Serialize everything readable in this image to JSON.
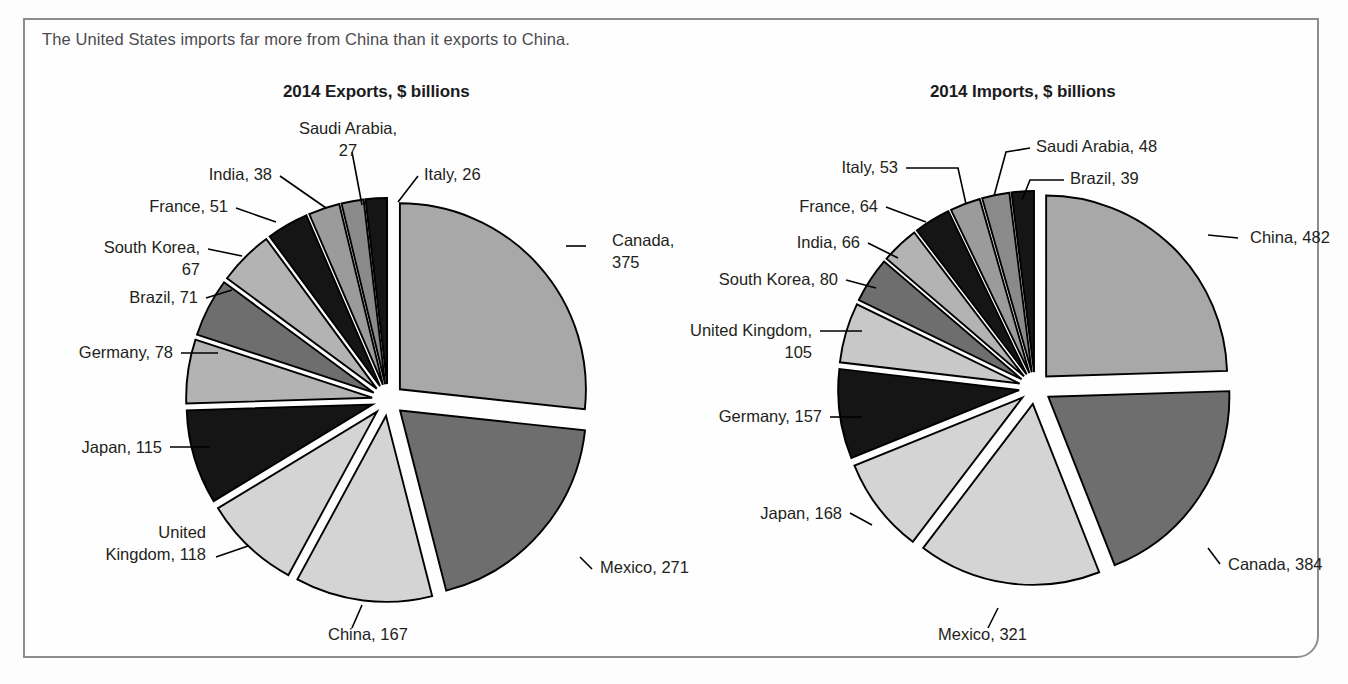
{
  "caption": "The United States imports far more from China than it exports to China.",
  "charts": [
    {
      "id": "exports",
      "title": "2014 Exports, $ billions",
      "unit": "$ billions",
      "center": {
        "x": 388,
        "y": 400
      },
      "radius": 186,
      "start_angle": -90,
      "slices": [
        {
          "label": "Canada",
          "value": 375,
          "text": "Canada,\n375",
          "color": "#a8a8a8",
          "lines": [
            "Canada,",
            "375"
          ],
          "label_x": 612,
          "label_y": 246,
          "anchor": "start",
          "leader": "M 566,246 L 586,246",
          "explode": 16
        },
        {
          "label": "Mexico",
          "value": 271,
          "text": "Mexico, 271",
          "color": "#6e6e6e",
          "lines": [
            "Mexico, 271"
          ],
          "label_x": 600,
          "label_y": 573,
          "anchor": "start",
          "leader": "M 580,557 L 592,569",
          "explode": 16
        },
        {
          "label": "China",
          "value": 167,
          "text": "China, 167",
          "color": "#d4d4d4",
          "lines": [
            "China, 167"
          ],
          "label_x": 328,
          "label_y": 640,
          "anchor": "start",
          "leader": "M 362,605 L 352,628",
          "explode": 16
        },
        {
          "label": "United Kingdom",
          "value": 118,
          "text": "United\nKingdom, 118",
          "color": "#d4d4d4",
          "lines": [
            "United",
            "Kingdom, 118"
          ],
          "label_x": 206,
          "label_y": 538,
          "anchor": "end",
          "leader": "M 216,557 L 248,546",
          "explode": 16
        },
        {
          "label": "Japan",
          "value": 115,
          "text": "Japan, 115",
          "color": "#151515",
          "lines": [
            "Japan, 115"
          ],
          "label_x": 162,
          "label_y": 453,
          "anchor": "end",
          "leader": "M 170,447 L 210,447",
          "explode": 16
        },
        {
          "label": "Germany",
          "value": 78,
          "text": "Germany, 78",
          "color": "#b3b3b3",
          "lines": [
            "Germany, 78"
          ],
          "label_x": 173,
          "label_y": 358,
          "anchor": "end",
          "leader": "M 181,353 L 218,353",
          "explode": 16
        },
        {
          "label": "Brazil",
          "value": 71,
          "text": "Brazil, 71",
          "color": "#6e6e6e",
          "lines": [
            "Brazil, 71"
          ],
          "label_x": 198,
          "label_y": 303,
          "anchor": "end",
          "leader": "M 206,298 L 232,290",
          "explode": 16
        },
        {
          "label": "South Korea",
          "value": 67,
          "text": "South Korea,\n67",
          "color": "#b3b3b3",
          "lines": [
            "South Korea,",
            "67"
          ],
          "label_x": 200,
          "label_y": 253,
          "anchor": "end",
          "leader": "M 208,249 L 242,256",
          "explode": 16
        },
        {
          "label": "France",
          "value": 51,
          "text": "France, 51",
          "color": "#151515",
          "lines": [
            "France, 51"
          ],
          "label_x": 228,
          "label_y": 212,
          "anchor": "end",
          "leader": "M 236,208 L 276,222",
          "explode": 16
        },
        {
          "label": "India",
          "value": 38,
          "text": "India, 38",
          "color": "#9b9b9b",
          "lines": [
            "India, 38"
          ],
          "label_x": 272,
          "label_y": 180,
          "anchor": "end",
          "leader": "M 280,176 L 326,208",
          "explode": 16
        },
        {
          "label": "Saudi Arabia",
          "value": 27,
          "text": "Saudi Arabia,\n27",
          "color": "#8a8a8a",
          "lines": [
            "Saudi Arabia,",
            "27"
          ],
          "label_x": 348,
          "label_y": 134,
          "anchor": "middle",
          "leader": "M 352,152 L 362,205",
          "explode": 16
        },
        {
          "label": "Italy",
          "value": 26,
          "text": "Italy, 26",
          "color": "#151515",
          "lines": [
            "Italy, 26"
          ],
          "label_x": 424,
          "label_y": 180,
          "anchor": "start",
          "leader": "M 418,176 L 398,202",
          "explode": 16
        }
      ]
    },
    {
      "id": "imports",
      "title": "2014 Imports, $ billions",
      "unit": "$ billions",
      "center": {
        "x": 1035,
        "y": 388
      },
      "radius": 181,
      "start_angle": -90,
      "slices": [
        {
          "label": "China",
          "value": 482,
          "text": "China, 482",
          "color": "#a8a8a8",
          "lines": [
            "China, 482"
          ],
          "label_x": 1250,
          "label_y": 243,
          "anchor": "start",
          "leader": "M 1208,235 L 1238,238",
          "explode": 16
        },
        {
          "label": "Canada",
          "value": 384,
          "text": "Canada, 384",
          "color": "#6e6e6e",
          "lines": [
            "Canada, 384"
          ],
          "label_x": 1228,
          "label_y": 570,
          "anchor": "start",
          "leader": "M 1208,548 L 1220,564",
          "explode": 16
        },
        {
          "label": "Mexico",
          "value": 321,
          "text": "Mexico, 321",
          "color": "#d4d4d4",
          "lines": [
            "Mexico, 321"
          ],
          "label_x": 938,
          "label_y": 640,
          "anchor": "start",
          "leader": "M 998,608 L 988,628",
          "explode": 16
        },
        {
          "label": "Japan",
          "value": 168,
          "text": "Japan, 168",
          "color": "#d4d4d4",
          "lines": [
            "Japan, 168"
          ],
          "label_x": 842,
          "label_y": 519,
          "anchor": "end",
          "leader": "M 850,513 L 872,525",
          "explode": 16
        },
        {
          "label": "Germany",
          "value": 157,
          "text": "Germany, 157",
          "color": "#151515",
          "lines": [
            "Germany, 157"
          ],
          "label_x": 822,
          "label_y": 422,
          "anchor": "end",
          "leader": "M 830,417 L 862,417",
          "explode": 16
        },
        {
          "label": "United Kingdom",
          "value": 105,
          "text": "United Kingdom,\n105",
          "color": "#c8c8c8",
          "lines": [
            "United Kingdom,",
            "105"
          ],
          "label_x": 812,
          "label_y": 336,
          "anchor": "end",
          "leader": "M 820,331 L 862,331",
          "explode": 16
        },
        {
          "label": "South Korea",
          "value": 80,
          "text": "South Korea, 80",
          "color": "#6e6e6e",
          "lines": [
            "South Korea, 80"
          ],
          "label_x": 838,
          "label_y": 285,
          "anchor": "end",
          "leader": "M 846,280 L 876,288",
          "explode": 16
        },
        {
          "label": "India",
          "value": 66,
          "text": "India, 66",
          "color": "#b3b3b3",
          "lines": [
            "India, 66"
          ],
          "label_x": 860,
          "label_y": 248,
          "anchor": "end",
          "leader": "M 868,243 L 898,258",
          "explode": 16
        },
        {
          "label": "France",
          "value": 64,
          "text": "France, 64",
          "color": "#151515",
          "lines": [
            "France, 64"
          ],
          "label_x": 878,
          "label_y": 212,
          "anchor": "end",
          "leader": "M 886,207 L 926,222",
          "explode": 16
        },
        {
          "label": "Italy",
          "value": 53,
          "text": "Italy, 53",
          "color": "#9b9b9b",
          "lines": [
            "Italy, 53"
          ],
          "label_x": 898,
          "label_y": 173,
          "anchor": "end",
          "leader": "M 906,168 L 958,168 L 966,204",
          "explode": 16
        },
        {
          "label": "Saudi Arabia",
          "value": 48,
          "text": "Saudi Arabia, 48",
          "color": "#8a8a8a",
          "lines": [
            "Saudi Arabia, 48"
          ],
          "label_x": 1036,
          "label_y": 152,
          "anchor": "start",
          "leader": "M 1030,148 L 1006,152 L 994,196",
          "explode": 16
        },
        {
          "label": "Brazil",
          "value": 39,
          "text": "Brazil, 39",
          "color": "#151515",
          "lines": [
            "Brazil, 39"
          ],
          "label_x": 1070,
          "label_y": 184,
          "anchor": "start",
          "leader": "M 1064,180 L 1030,180 L 1022,200",
          "explode": 16
        }
      ]
    }
  ]
}
